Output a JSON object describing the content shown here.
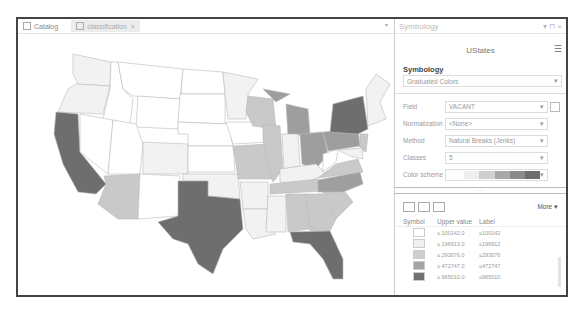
{
  "map_view": {
    "tabs": [
      {
        "label": "Catalog",
        "icon": "catalog-icon",
        "active": false
      },
      {
        "label": "classification",
        "icon": "map-icon",
        "active": true,
        "close": "×"
      }
    ],
    "overflow_caret": "▾",
    "state_colors": {
      "class1": "#ffffff",
      "class2": "#f2f2f2",
      "class3": "#c9c9c9",
      "class4": "#9e9e9e",
      "class5": "#6e6e6e"
    }
  },
  "panel": {
    "title": "Symbology",
    "title_controls": "▾ ⊓ ×",
    "layer_name": "UStates",
    "menu_icon": "☰",
    "section_title": "Symbology",
    "renderer": "Graduated Colors",
    "fields": [
      {
        "label": "Field",
        "value": "VACANT"
      },
      {
        "label": "Normalization",
        "value": "<None>"
      },
      {
        "label": "Method",
        "value": "Natural Breaks (Jenks)"
      },
      {
        "label": "Classes",
        "value": "5"
      },
      {
        "label": "Color scheme",
        "value": ""
      }
    ],
    "color_ramp": [
      "#ffffff",
      "#eeeeee",
      "#cfcfcf",
      "#a8a8a8",
      "#8a8a8a",
      "#6e6e6e"
    ],
    "more_label": "More",
    "table": {
      "headers": [
        "Symbol",
        "Upper value",
        "Label"
      ],
      "rows": [
        {
          "color": "#ffffff",
          "upper": "≤  100142.0",
          "label": "≤100142"
        },
        {
          "color": "#f0f0f0",
          "upper": "≤  196913.0",
          "label": "≤196912"
        },
        {
          "color": "#cfcfcf",
          "upper": "≤  293076.0",
          "label": "≤293076"
        },
        {
          "color": "#a4a4a4",
          "upper": "≤  472747.0",
          "label": "≤472747"
        },
        {
          "color": "#707070",
          "upper": "≤  965010.0",
          "label": "≤965010"
        }
      ]
    }
  }
}
